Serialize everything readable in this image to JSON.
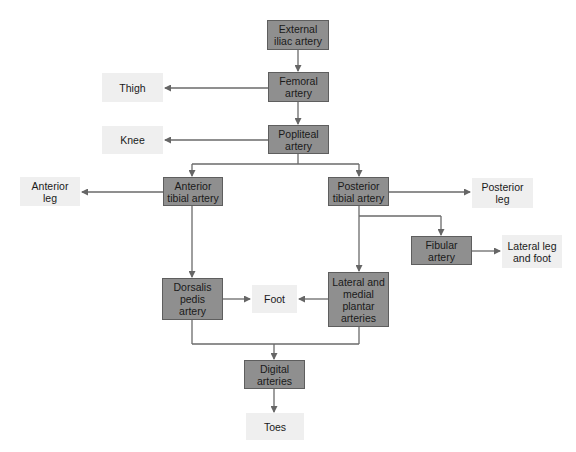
{
  "diagram": {
    "type": "flowchart",
    "colors": {
      "artery_fill": "#8f8f8f",
      "artery_border": "#5e5e5e",
      "target_fill": "#efefef",
      "line": "#666666"
    },
    "nodes": {
      "external_iliac": {
        "label": "External\niliac artery",
        "kind": "artery"
      },
      "femoral": {
        "label": "Femoral\nartery",
        "kind": "artery"
      },
      "popliteal": {
        "label": "Popliteal\nartery",
        "kind": "artery"
      },
      "anterior_tibial": {
        "label": "Anterior\ntibial artery",
        "kind": "artery"
      },
      "posterior_tibial": {
        "label": "Posterior\ntibial artery",
        "kind": "artery"
      },
      "fibular": {
        "label": "Fibular\nartery",
        "kind": "artery"
      },
      "dorsalis_pedis": {
        "label": "Dorsalis\npedis\nartery",
        "kind": "artery"
      },
      "plantar": {
        "label": "Lateral and\nmedial\nplantar\narteries",
        "kind": "artery"
      },
      "digital": {
        "label": "Digital\narteries",
        "kind": "artery"
      },
      "thigh": {
        "label": "Thigh",
        "kind": "region"
      },
      "knee": {
        "label": "Knee",
        "kind": "region"
      },
      "anterior_leg": {
        "label": "Anterior\nleg",
        "kind": "region"
      },
      "posterior_leg": {
        "label": "Posterior\nleg",
        "kind": "region"
      },
      "lateral_leg_foot": {
        "label": "Lateral leg\nand foot",
        "kind": "region"
      },
      "foot": {
        "label": "Foot",
        "kind": "region"
      },
      "toes": {
        "label": "Toes",
        "kind": "region"
      }
    },
    "edges": [
      [
        "external_iliac",
        "femoral"
      ],
      [
        "femoral",
        "thigh"
      ],
      [
        "femoral",
        "popliteal"
      ],
      [
        "popliteal",
        "knee"
      ],
      [
        "popliteal",
        "anterior_tibial"
      ],
      [
        "popliteal",
        "posterior_tibial"
      ],
      [
        "anterior_tibial",
        "anterior_leg"
      ],
      [
        "anterior_tibial",
        "dorsalis_pedis"
      ],
      [
        "posterior_tibial",
        "posterior_leg"
      ],
      [
        "posterior_tibial",
        "fibular"
      ],
      [
        "posterior_tibial",
        "plantar"
      ],
      [
        "fibular",
        "lateral_leg_foot"
      ],
      [
        "dorsalis_pedis",
        "foot"
      ],
      [
        "plantar",
        "foot"
      ],
      [
        "dorsalis_pedis",
        "digital"
      ],
      [
        "plantar",
        "digital"
      ],
      [
        "digital",
        "toes"
      ]
    ]
  }
}
